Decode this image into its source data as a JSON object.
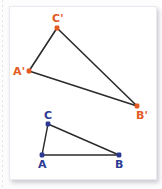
{
  "figure": {
    "canvas": {
      "width": 162,
      "height": 189
    },
    "colors": {
      "image_triangle": "#e35a22",
      "preimage_triangle": "#2d3a93",
      "edge_stroke": "#2b2b2b",
      "card_background": "#ffffff",
      "page_background": "#fdfdfe",
      "card_border": "#e9e9ef"
    },
    "triangles": [
      {
        "name": "image-triangle",
        "id": "A'B'C'",
        "vertex_color": "#e35a22",
        "label_color": "#e35a22",
        "edge_color": "#2b2b2b",
        "edge_width": 1.6,
        "vertices": [
          {
            "label": "C'",
            "x": 57,
            "y": 28,
            "label_x": 52,
            "label_y": 13
          },
          {
            "label": "A'",
            "x": 29,
            "y": 71,
            "label_x": 13,
            "label_y": 66
          },
          {
            "label": "B'",
            "x": 137,
            "y": 106,
            "label_x": 136,
            "label_y": 110
          }
        ],
        "edges": [
          [
            "C'",
            "A'"
          ],
          [
            "C'",
            "B'"
          ],
          [
            "A'",
            "B'"
          ]
        ]
      },
      {
        "name": "preimage-triangle",
        "id": "ABC",
        "vertex_color": "#2d3a93",
        "label_color": "#2d3a93",
        "edge_color": "#2b2b2b",
        "edge_width": 1.4,
        "vertices": [
          {
            "label": "C",
            "x": 48,
            "y": 124,
            "label_x": 44,
            "label_y": 110
          },
          {
            "label": "A",
            "x": 42,
            "y": 155,
            "label_x": 38,
            "label_y": 159
          },
          {
            "label": "B",
            "x": 119,
            "y": 155,
            "label_x": 115,
            "label_y": 159
          }
        ],
        "edges": [
          [
            "C",
            "A"
          ],
          [
            "C",
            "B"
          ],
          [
            "A",
            "B"
          ]
        ]
      }
    ]
  }
}
